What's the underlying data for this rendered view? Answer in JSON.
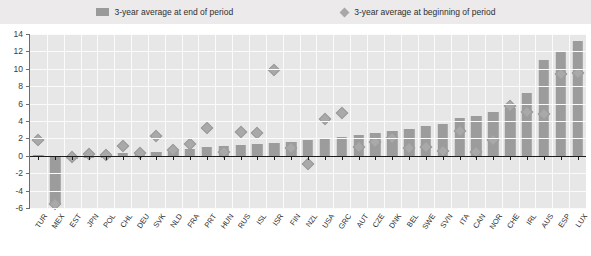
{
  "legend": {
    "items": [
      {
        "label": "3-year average at end of period",
        "marker": "bar-swatch"
      },
      {
        "label": "3-year average at beginning of period",
        "marker": "diamond-marker"
      }
    ]
  },
  "chart_data": {
    "type": "bar",
    "title": "",
    "subtitle": "",
    "xlabel": "",
    "ylabel": "",
    "ylim": [
      -6,
      14
    ],
    "yticks": [
      -6,
      -4,
      -2,
      0,
      2,
      4,
      6,
      8,
      10,
      12,
      14
    ],
    "grid": true,
    "legend_position": "top",
    "categories": [
      "TUR",
      "MEX",
      "EST",
      "JPN",
      "POL",
      "CHL",
      "DEU",
      "SVK",
      "NLD",
      "FRA",
      "PRT",
      "HUN",
      "RUS",
      "ISL",
      "ISR",
      "FIN",
      "NZL",
      "USA",
      "GRC",
      "AUT",
      "CZE",
      "DNK",
      "BEL",
      "SWE",
      "SVN",
      "ITA",
      "CAN",
      "NOR",
      "CHE",
      "IRL",
      "AUS",
      "ESP",
      "LUX"
    ],
    "series": [
      {
        "name": "3-year average at end of period",
        "type": "bar",
        "values": [
          0.05,
          -5.5,
          -0.35,
          -0.25,
          -0.3,
          0.3,
          0.35,
          0.4,
          0.7,
          0.8,
          1.0,
          1.1,
          1.2,
          1.3,
          1.5,
          1.6,
          1.8,
          2.0,
          2.2,
          2.4,
          2.6,
          2.9,
          3.1,
          3.4,
          3.7,
          4.3,
          4.6,
          5.0,
          5.5,
          7.2,
          11.0,
          12.0,
          13.2
        ]
      },
      {
        "name": "3-year average at beginning of period",
        "type": "scatter",
        "values": [
          1.8,
          -5.5,
          -0.1,
          0.2,
          0.1,
          1.1,
          0.3,
          2.3,
          0.7,
          1.4,
          3.2,
          0.4,
          2.7,
          2.6,
          9.9,
          0.9,
          -0.9,
          4.2,
          4.9,
          1.0,
          1.6,
          2.1,
          0.9,
          1.0,
          0.5,
          2.9,
          0.4,
          1.8,
          5.7,
          5.0,
          4.8,
          9.4,
          9.5
        ]
      }
    ]
  }
}
